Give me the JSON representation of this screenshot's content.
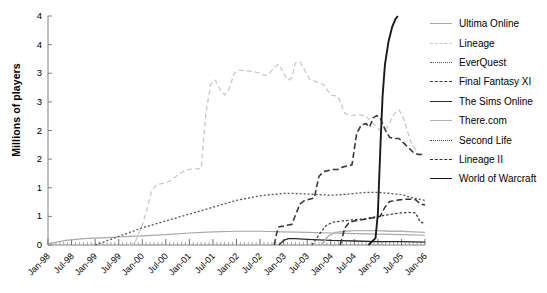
{
  "chart_data": {
    "type": "line",
    "title": "",
    "xlabel": "",
    "ylabel": "Millions of players",
    "ylim": [
      0,
      4
    ],
    "yticks": [
      0,
      0.5,
      1,
      1.5,
      2,
      2.5,
      3,
      3.5,
      4
    ],
    "ytick_labels": [
      "0",
      "1",
      "1",
      "2",
      "2",
      "3",
      "3",
      "4",
      "4"
    ],
    "grid": false,
    "legend_position": "right",
    "x": [
      "Jan-98",
      "Jul-98",
      "Jan-99",
      "Jul-99",
      "Jan-00",
      "Jul-00",
      "Jan-01",
      "Jul-01",
      "Jan-02",
      "Jul-02",
      "Jan-03",
      "Jul-03",
      "Jan-04",
      "Jul-04",
      "Jan-05",
      "Jul-05",
      "Jan-06"
    ],
    "xtick_labels": [
      "Jan-98",
      "Jul-98",
      "Jan-99",
      "Jul-99",
      "Jan-00",
      "Jul-00",
      "Jan-01",
      "Jul-01",
      "Jan-02",
      "Jul-02",
      "Jan-03",
      "Jul-03",
      "Jan-04",
      "Jul-04",
      "Jan-05",
      "Jul-05",
      "Jan-06"
    ],
    "x_minor_ticks_per_interval": 6,
    "series": [
      {
        "name": "Ultima Online",
        "color": "#a8a8a8",
        "style": "solid",
        "dash": "",
        "width": 1.2,
        "points": [
          [
            0,
            0.02
          ],
          [
            0.25,
            0.04
          ],
          [
            0.5,
            0.06
          ],
          [
            0.75,
            0.08
          ],
          [
            1,
            0.09
          ],
          [
            1.5,
            0.11
          ],
          [
            2,
            0.12
          ],
          [
            2.5,
            0.13
          ],
          [
            3,
            0.14
          ],
          [
            3.5,
            0.15
          ],
          [
            4,
            0.16
          ],
          [
            5,
            0.18
          ],
          [
            6,
            0.21
          ],
          [
            7,
            0.23
          ],
          [
            8,
            0.24
          ],
          [
            9,
            0.24
          ],
          [
            10,
            0.23
          ],
          [
            11,
            0.22
          ],
          [
            12,
            0.21
          ],
          [
            13,
            0.2
          ],
          [
            14,
            0.19
          ],
          [
            15,
            0.18
          ],
          [
            16,
            0.17
          ]
        ]
      },
      {
        "name": "Lineage",
        "color": "#c9c9c9",
        "style": "dashed",
        "dash": "5,3",
        "width": 1.3,
        "points": [
          [
            3.4,
            0.0
          ],
          [
            3.7,
            0.05
          ],
          [
            4.0,
            0.35
          ],
          [
            4.2,
            0.62
          ],
          [
            4.4,
            0.95
          ],
          [
            4.6,
            1.05
          ],
          [
            4.9,
            1.08
          ],
          [
            5.2,
            1.12
          ],
          [
            5.5,
            1.22
          ],
          [
            5.8,
            1.3
          ],
          [
            6.0,
            1.32
          ],
          [
            6.3,
            1.33
          ],
          [
            6.5,
            1.34
          ],
          [
            6.7,
            2.3
          ],
          [
            6.9,
            2.8
          ],
          [
            7.1,
            2.88
          ],
          [
            7.3,
            2.72
          ],
          [
            7.5,
            2.62
          ],
          [
            7.7,
            2.74
          ],
          [
            7.9,
            3.0
          ],
          [
            8.1,
            3.05
          ],
          [
            8.4,
            3.05
          ],
          [
            8.7,
            3.03
          ],
          [
            9.0,
            3.0
          ],
          [
            9.2,
            2.96
          ],
          [
            9.4,
            3.0
          ],
          [
            9.6,
            3.1
          ],
          [
            9.8,
            3.16
          ],
          [
            10.0,
            3.0
          ],
          [
            10.2,
            2.88
          ],
          [
            10.35,
            2.92
          ],
          [
            10.5,
            3.18
          ],
          [
            10.7,
            3.2
          ],
          [
            10.9,
            3.05
          ],
          [
            11.1,
            2.9
          ],
          [
            11.4,
            2.85
          ],
          [
            11.7,
            2.8
          ],
          [
            12.0,
            2.62
          ],
          [
            12.3,
            2.6
          ],
          [
            12.6,
            2.3
          ],
          [
            12.9,
            2.26
          ],
          [
            13.2,
            2.28
          ],
          [
            13.5,
            2.25
          ],
          [
            13.8,
            2.12
          ],
          [
            14.1,
            2.0
          ],
          [
            14.4,
            2.05
          ],
          [
            14.7,
            2.3
          ],
          [
            14.9,
            2.36
          ],
          [
            15.1,
            2.2
          ],
          [
            15.4,
            1.8
          ],
          [
            15.7,
            1.6
          ],
          [
            16.0,
            1.58
          ]
        ]
      },
      {
        "name": "EverQuest",
        "color": "#555555",
        "style": "dotted",
        "dash": "2,2",
        "width": 1.3,
        "points": [
          [
            2.0,
            0.0
          ],
          [
            2.4,
            0.06
          ],
          [
            2.8,
            0.12
          ],
          [
            3.2,
            0.18
          ],
          [
            3.6,
            0.24
          ],
          [
            4.0,
            0.3
          ],
          [
            4.5,
            0.36
          ],
          [
            5.0,
            0.42
          ],
          [
            5.5,
            0.48
          ],
          [
            6.0,
            0.54
          ],
          [
            6.5,
            0.6
          ],
          [
            7.0,
            0.66
          ],
          [
            7.5,
            0.72
          ],
          [
            8.0,
            0.78
          ],
          [
            8.5,
            0.82
          ],
          [
            9.0,
            0.86
          ],
          [
            9.5,
            0.88
          ],
          [
            10.0,
            0.9
          ],
          [
            10.5,
            0.9
          ],
          [
            11.0,
            0.89
          ],
          [
            11.5,
            0.88
          ],
          [
            12.0,
            0.87
          ],
          [
            12.5,
            0.88
          ],
          [
            13.0,
            0.9
          ],
          [
            13.5,
            0.92
          ],
          [
            14.0,
            0.92
          ],
          [
            14.5,
            0.9
          ],
          [
            15.0,
            0.88
          ],
          [
            15.5,
            0.82
          ],
          [
            16.0,
            0.78
          ]
        ]
      },
      {
        "name": "Final Fantasy XI",
        "color": "#3a3a3a",
        "style": "dashed",
        "dash": "6,3",
        "width": 1.6,
        "points": [
          [
            9.6,
            0.0
          ],
          [
            9.7,
            0.2
          ],
          [
            9.8,
            0.32
          ],
          [
            10.0,
            0.33
          ],
          [
            10.2,
            0.35
          ],
          [
            10.35,
            0.36
          ],
          [
            10.5,
            0.52
          ],
          [
            10.7,
            0.72
          ],
          [
            10.9,
            0.78
          ],
          [
            11.1,
            0.8
          ],
          [
            11.3,
            0.82
          ],
          [
            11.5,
            1.2
          ],
          [
            11.7,
            1.28
          ],
          [
            11.9,
            1.3
          ],
          [
            12.1,
            1.32
          ],
          [
            12.3,
            1.32
          ],
          [
            12.5,
            1.36
          ],
          [
            12.7,
            1.38
          ],
          [
            12.9,
            1.4
          ],
          [
            13.1,
            1.95
          ],
          [
            13.3,
            2.1
          ],
          [
            13.5,
            2.12
          ],
          [
            13.65,
            2.06
          ],
          [
            13.8,
            2.22
          ],
          [
            13.95,
            2.26
          ],
          [
            14.1,
            2.22
          ],
          [
            14.3,
            2.02
          ],
          [
            14.5,
            1.88
          ],
          [
            14.7,
            1.86
          ],
          [
            14.9,
            1.86
          ],
          [
            15.1,
            1.78
          ],
          [
            15.3,
            1.7
          ],
          [
            15.5,
            1.62
          ],
          [
            15.7,
            1.58
          ],
          [
            16.0,
            1.58
          ]
        ]
      },
      {
        "name": "The Sims Online",
        "color": "#2a2a2a",
        "style": "solid",
        "dash": "",
        "width": 1.3,
        "points": [
          [
            9.8,
            0.0
          ],
          [
            10.0,
            0.08
          ],
          [
            10.2,
            0.11
          ],
          [
            10.5,
            0.11
          ],
          [
            11.0,
            0.1
          ],
          [
            11.5,
            0.09
          ],
          [
            12.0,
            0.08
          ],
          [
            13.0,
            0.07
          ],
          [
            14.0,
            0.06
          ],
          [
            15.0,
            0.06
          ],
          [
            16.0,
            0.05
          ]
        ]
      },
      {
        "name": "There.com",
        "color": "#b0b0b0",
        "style": "solid",
        "dash": "",
        "width": 1.3,
        "points": [
          [
            11.6,
            0.0
          ],
          [
            11.9,
            0.16
          ],
          [
            12.2,
            0.22
          ],
          [
            12.6,
            0.24
          ],
          [
            13.0,
            0.25
          ],
          [
            13.5,
            0.25
          ],
          [
            14.0,
            0.25
          ],
          [
            14.5,
            0.24
          ],
          [
            15.0,
            0.24
          ],
          [
            15.5,
            0.23
          ],
          [
            16.0,
            0.22
          ]
        ]
      },
      {
        "name": "Second Life",
        "color": "#404040",
        "style": "dotted",
        "dash": "2.5,2",
        "width": 1.3,
        "points": [
          [
            11.2,
            0.0
          ],
          [
            11.5,
            0.18
          ],
          [
            11.8,
            0.34
          ],
          [
            12.1,
            0.4
          ],
          [
            12.5,
            0.42
          ],
          [
            13.0,
            0.44
          ],
          [
            13.5,
            0.46
          ],
          [
            14.0,
            0.5
          ],
          [
            14.3,
            0.52
          ],
          [
            14.6,
            0.54
          ],
          [
            15.0,
            0.56
          ],
          [
            15.3,
            0.57
          ],
          [
            15.6,
            0.56
          ],
          [
            15.8,
            0.4
          ],
          [
            16.0,
            0.38
          ]
        ]
      },
      {
        "name": "Lineage II",
        "color": "#303030",
        "style": "dashed",
        "dash": "6,3",
        "width": 1.5,
        "points": [
          [
            12.4,
            0.0
          ],
          [
            12.6,
            0.3
          ],
          [
            12.8,
            0.4
          ],
          [
            13.0,
            0.42
          ],
          [
            13.3,
            0.44
          ],
          [
            13.6,
            0.46
          ],
          [
            13.9,
            0.48
          ],
          [
            14.1,
            0.5
          ],
          [
            14.3,
            0.66
          ],
          [
            14.5,
            0.76
          ],
          [
            14.8,
            0.78
          ],
          [
            15.1,
            0.8
          ],
          [
            15.4,
            0.8
          ],
          [
            15.6,
            0.79
          ],
          [
            15.8,
            0.72
          ],
          [
            16.0,
            0.7
          ]
        ]
      },
      {
        "name": "World of Warcraft",
        "color": "#1a1a1a",
        "style": "solid",
        "dash": "",
        "width": 1.9,
        "points": [
          [
            13.6,
            0.0
          ],
          [
            13.75,
            0.06
          ],
          [
            13.9,
            0.12
          ],
          [
            14.0,
            0.55
          ],
          [
            14.05,
            1.1
          ],
          [
            14.12,
            1.85
          ],
          [
            14.2,
            2.6
          ],
          [
            14.3,
            3.15
          ],
          [
            14.45,
            3.55
          ],
          [
            14.6,
            3.8
          ],
          [
            14.75,
            3.95
          ],
          [
            14.85,
            4.0
          ]
        ]
      }
    ]
  },
  "axes": {
    "y_axis_title": "Millions of players"
  },
  "legend": {
    "entries": [
      {
        "label": "Ultima Online"
      },
      {
        "label": "Lineage"
      },
      {
        "label": "EverQuest"
      },
      {
        "label": "Final Fantasy XI"
      },
      {
        "label": "The Sims Online"
      },
      {
        "label": "There.com"
      },
      {
        "label": "Second Life"
      },
      {
        "label": "Lineage II"
      },
      {
        "label": "World of Warcraft"
      }
    ]
  }
}
